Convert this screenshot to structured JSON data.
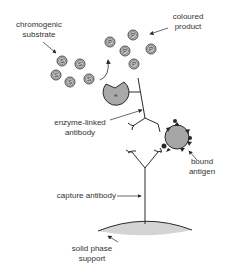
{
  "diagram": {
    "type": "sandwich ELISA schematic",
    "labels": {
      "chromogenic_substrate": [
        "chromogenic",
        "substrate"
      ],
      "coloured_product": [
        "coloured",
        "product"
      ],
      "enzyme_linked_antibody": [
        "enzyme-linked",
        "antibody"
      ],
      "bound_antigen": [
        "bound",
        "antigen"
      ],
      "capture_antibody": "capture antibody",
      "solid_phase_support": [
        "solid phase",
        "support"
      ]
    },
    "symbols": {
      "substrate": "S",
      "product": "P",
      "enzyme": "e"
    },
    "colors": {
      "line": "#2a2a2a",
      "circle_fill": "#c8c8c8",
      "enzyme_fill": "#a9a9a9",
      "antigen_fill": "#a6a6a6",
      "support_fill": "#d4d4d4",
      "text": "#333333"
    }
  }
}
